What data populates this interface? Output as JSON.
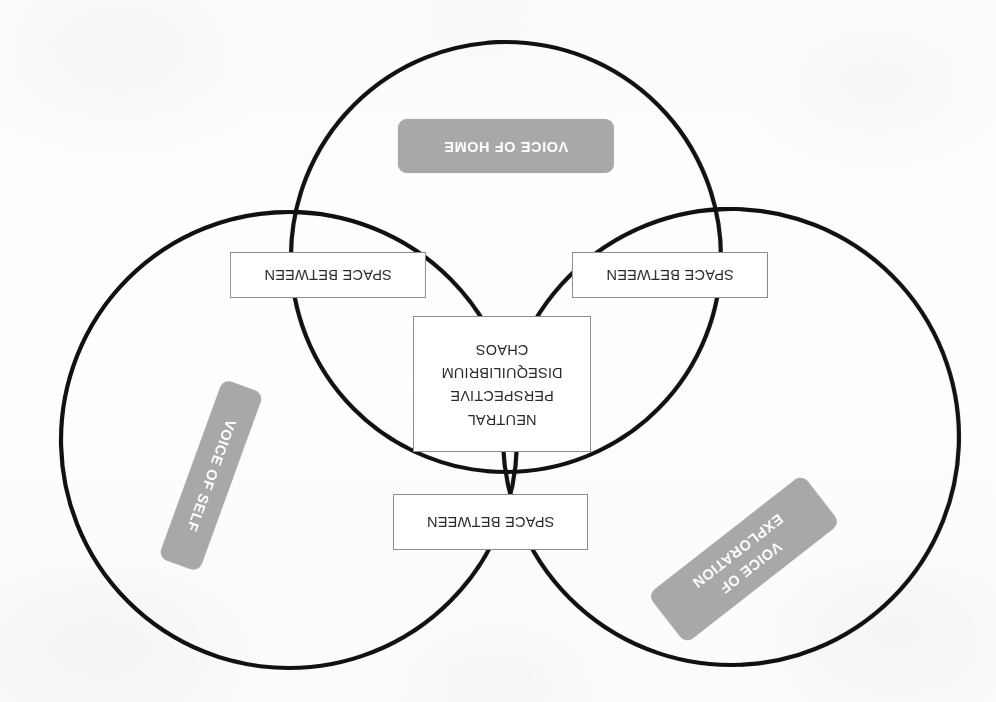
{
  "diagram": {
    "type": "venn-3-circle",
    "orientation": "rotated-180",
    "colors": {
      "circle_stroke": "#111111",
      "pill_fill": "#a8a8a8",
      "pill_text": "#ffffff",
      "box_fill": "#ffffff",
      "box_border": "#8d8d8d",
      "box_text": "#2b2b2b",
      "background": "#fdfdfb"
    },
    "circles": [
      {
        "id": "voice-of-exploration",
        "cx": 265,
        "cy": 265,
        "r": 228
      },
      {
        "id": "voice-of-self",
        "cx": 707,
        "cy": 262,
        "r": 228
      },
      {
        "id": "voice-of-home",
        "cx": 490,
        "cy": 445,
        "r": 215
      }
    ],
    "pills": [
      {
        "id": "voice-of-exploration",
        "lines": [
          "VOICE OF",
          "EXPLORATION"
        ],
        "rotation_deg": -38
      },
      {
        "id": "voice-of-self",
        "lines": [
          "VOICE OF SELF"
        ],
        "rotation_deg": -70
      },
      {
        "id": "voice-of-home",
        "lines": [
          "VOICE OF HOME"
        ],
        "rotation_deg": 0
      }
    ],
    "intersection_labels": {
      "top": "SPACE BETWEEN",
      "left": "SPACE BETWEEN",
      "right": "SPACE BETWEEN"
    },
    "center_label": {
      "lines": [
        "NEUTRAL",
        "PERSPECTIVE",
        "DISEQUILIBRIUM",
        "CHAOS"
      ]
    }
  }
}
